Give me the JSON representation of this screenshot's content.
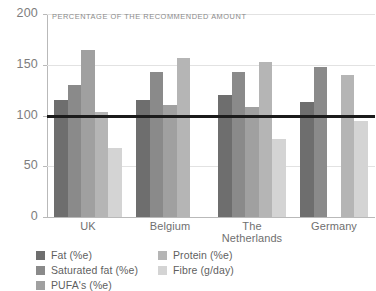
{
  "chart_data": {
    "type": "bar",
    "title": "",
    "subtitle": "PERCENTAGE OF THE RECOMMENDED AMOUNT",
    "xlabel": "",
    "ylabel": "",
    "ylim": [
      0,
      200
    ],
    "yticks": [
      0,
      50,
      100,
      150,
      200
    ],
    "grid": true,
    "legend_position": "bottom-left",
    "reference_line": {
      "value": 100,
      "color": "#1b1b1b",
      "label": ""
    },
    "categories": [
      "UK",
      "Belgium",
      "The Netherlands",
      "Germany"
    ],
    "series": [
      {
        "name": "Fat (%e)",
        "color": "#6e6e6e",
        "values": [
          115,
          115,
          120,
          113
        ]
      },
      {
        "name": "Saturated fat (%e)",
        "color": "#8a8a8a",
        "values": [
          130,
          143,
          143,
          148
        ]
      },
      {
        "name": "PUFA's (%e)",
        "color": "#a0a0a0",
        "values": [
          165,
          110,
          108,
          null
        ]
      },
      {
        "name": "Protein (%e)",
        "color": "#b5b5b5",
        "values": [
          103,
          157,
          153,
          140
        ]
      },
      {
        "name": "Fibre (g/day)",
        "color": "#d4d4d4",
        "values": [
          68,
          null,
          77,
          95
        ]
      }
    ]
  },
  "legend": {
    "columns": [
      [
        {
          "label": "Fat (%e)",
          "color": "#6e6e6e"
        },
        {
          "label": "Saturated fat (%e)",
          "color": "#8a8a8a"
        },
        {
          "label": "PUFA's (%e)",
          "color": "#a0a0a0"
        }
      ],
      [
        {
          "label": "Protein (%e)",
          "color": "#b5b5b5"
        },
        {
          "label": "Fibre (g/day)",
          "color": "#d4d4d4"
        }
      ]
    ]
  },
  "axis": {
    "y_tick_labels": [
      "200",
      "150",
      "100",
      "50",
      "0"
    ]
  }
}
